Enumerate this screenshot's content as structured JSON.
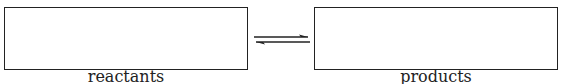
{
  "diagram": {
    "left_box": {
      "label": "reactants",
      "content": ""
    },
    "right_box": {
      "label": "products",
      "content": ""
    },
    "arrow": {
      "type": "equilibrium-arrow",
      "color": "#222222"
    }
  }
}
